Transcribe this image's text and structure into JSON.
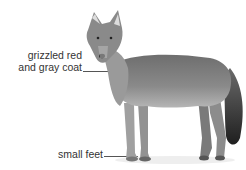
{
  "image": {
    "subject": "coyote",
    "description": "Grayscale photo of a standing coyote facing left, looking at viewer, with two annotation labels",
    "annotations": [
      {
        "text_line1": "grizzled red",
        "text_line2": "and gray coat"
      },
      {
        "text_line1": "small feet"
      }
    ]
  }
}
